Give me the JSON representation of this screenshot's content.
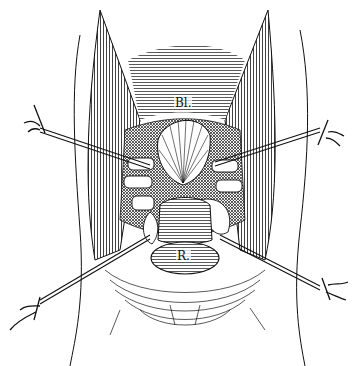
{
  "figure": {
    "kind": "anatomical engraving",
    "colors": {
      "ink": "#111111",
      "paper": "#ffffff"
    },
    "labels": [
      {
        "id": "bladder",
        "text": "Bl."
      },
      {
        "id": "rectum",
        "text": "R."
      }
    ],
    "retractors": 4
  }
}
